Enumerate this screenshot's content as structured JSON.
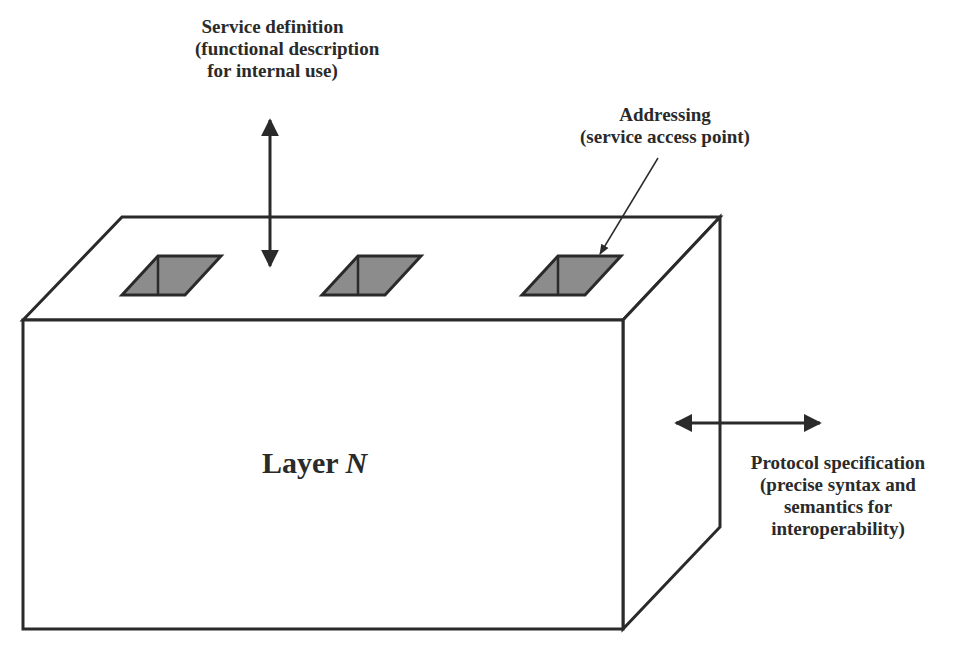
{
  "diagram": {
    "type": "layer-model-box",
    "layer_label": {
      "prefix": "Layer ",
      "variable": "N"
    },
    "labels": {
      "service_definition": {
        "lines": [
          "Service definition",
          "(functional description",
          "for internal use)"
        ]
      },
      "addressing": {
        "lines": [
          "Addressing",
          "(service access point)"
        ]
      },
      "protocol_specification": {
        "lines": [
          "Protocol specification",
          "(precise syntax and",
          "semantics for",
          "interoperability)"
        ]
      }
    },
    "service_access_points": [
      {
        "name": "sap-1"
      },
      {
        "name": "sap-2"
      },
      {
        "name": "sap-3"
      }
    ],
    "colors": {
      "stroke": "#2a2a2a",
      "sap_fill": "#8c8c8c",
      "background": "#ffffff"
    }
  }
}
